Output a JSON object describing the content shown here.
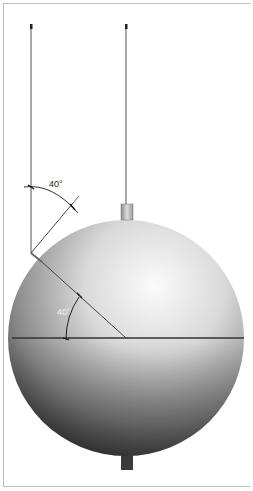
{
  "diagram": {
    "angle_labels": {
      "upper": "40°",
      "lower": "40°"
    },
    "colors": {
      "frame": "#bdbdbd",
      "sphere_light": "#fafafa",
      "sphere_dark": "#2e2e2e",
      "line": "#333333"
    }
  }
}
